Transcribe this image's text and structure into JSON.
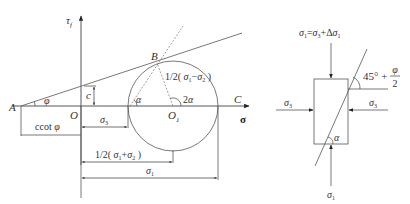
{
  "mohr_diagram": {
    "axes": {
      "tau_label": "τ",
      "tau_sub": "f",
      "sigma_label": "σ"
    },
    "points": {
      "A": "A",
      "B": "B",
      "C": "C",
      "O": "O",
      "O1": "O",
      "O1_sub": "1"
    },
    "angles": {
      "phi": "φ",
      "alpha": "α",
      "two_alpha": "2α"
    },
    "labels": {
      "cohesion": "c",
      "radius": "1/2(σ",
      "radius_full": "1/2( σ₁−σ₂ )",
      "center_dist": "1/2( σ₁+σ₂ )",
      "ccot": "ccot φ",
      "sigma3": "σ₃",
      "sigma1": "σ₁"
    }
  },
  "element_diagram": {
    "top_load": "σ₁=σ₃+Δσ₁",
    "bottom_load": "σ₁",
    "left_load": "σ₃",
    "right_load": "σ₃",
    "failure_angle_prefix": "45° +",
    "failure_angle_num": "φ",
    "failure_angle_den": "2",
    "inner_angle": "α"
  }
}
